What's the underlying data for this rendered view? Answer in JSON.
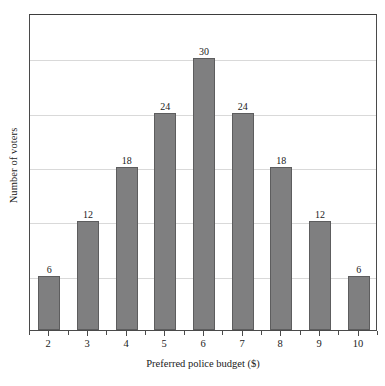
{
  "chart_data": {
    "type": "bar",
    "title": "",
    "xlabel": "Preferred police budget ($)",
    "ylabel": "Number of voters",
    "categories": [
      "2",
      "3",
      "4",
      "5",
      "6",
      "7",
      "8",
      "9",
      "10"
    ],
    "values": [
      6,
      12,
      18,
      24,
      30,
      24,
      18,
      12,
      6
    ],
    "value_labels": [
      "6",
      "12",
      "18",
      "24",
      "30",
      "24",
      "18",
      "12",
      "6"
    ],
    "ylim": [
      0,
      35
    ],
    "ytick_values": [
      6,
      12,
      18,
      24,
      30
    ],
    "ytick_labels_shown": false,
    "grid": true,
    "grid_axis": "y",
    "legend": false,
    "bar_color": "#7f7f80",
    "bar_edge_color": "#5d5d5e",
    "grid_color": "#d9d9d9",
    "axis_color": "#4a4a4a",
    "text_color": "#1a1a1a",
    "minor_xticks": true
  },
  "axes": {
    "x_title": "Preferred police budget ($)",
    "y_title": "Number of voters"
  }
}
